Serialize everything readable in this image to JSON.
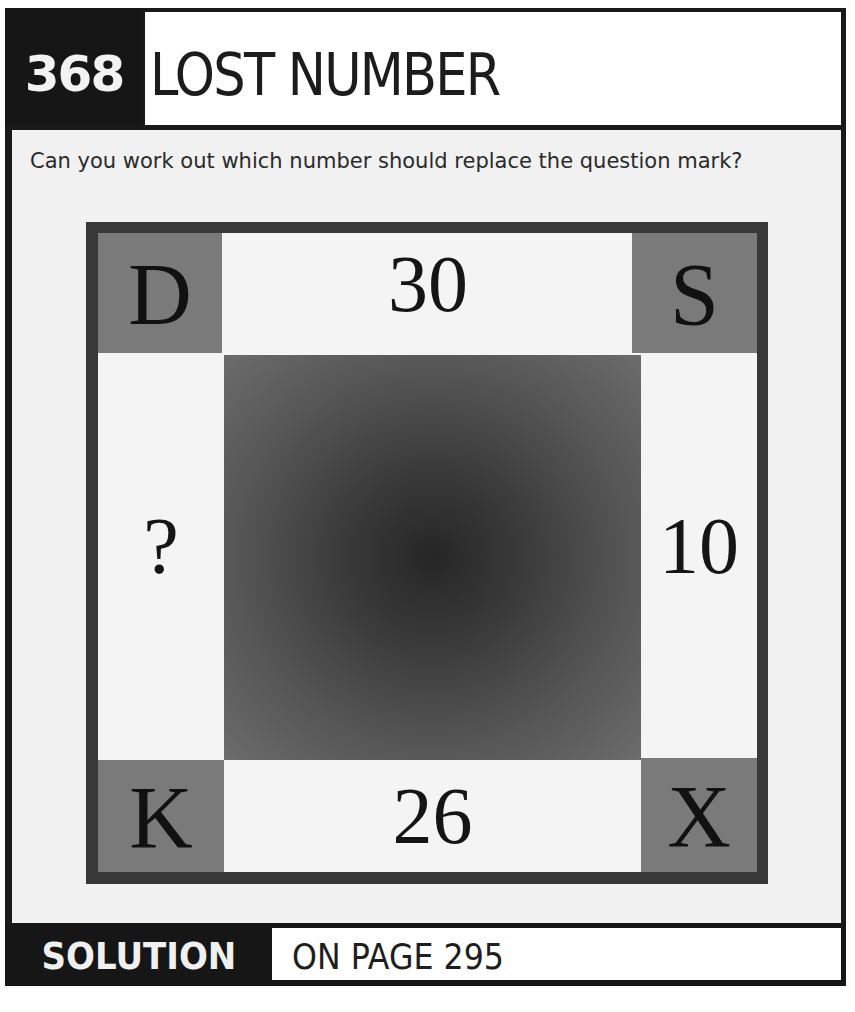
{
  "header": {
    "puzzle_number": "368",
    "title": "LOST NUMBER"
  },
  "question": "Can you work out which number should replace the question mark?",
  "puzzle": {
    "corners": {
      "top_left": "D",
      "top_right": "S",
      "bottom_left": "K",
      "bottom_right": "X"
    },
    "edges": {
      "top": "30",
      "right": "10",
      "bottom": "26",
      "left": "?"
    },
    "colors": {
      "frame": "#383838",
      "corner_fill": "#7a7a7a",
      "edge_fill": "#f4f4f4",
      "center_dark": "#262626",
      "center_light": "#6c6c6c"
    }
  },
  "footer": {
    "label": "SOLUTION",
    "page_text": "ON PAGE 295"
  }
}
